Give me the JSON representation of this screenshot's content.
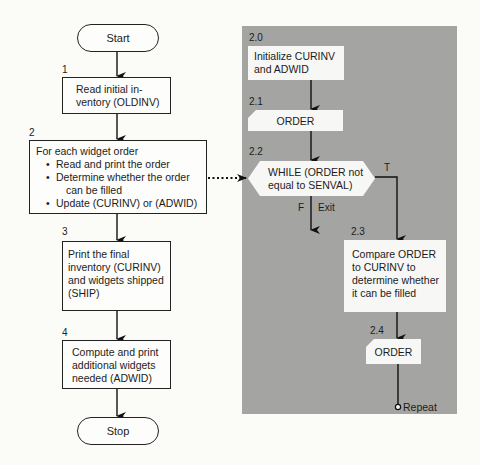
{
  "left_flow": {
    "start": {
      "label": "Start"
    },
    "step1": {
      "number": "1",
      "lines": [
        "Read initial in-",
        "ventory (OLDINV)"
      ]
    },
    "step2": {
      "number": "2",
      "heading": "For each widget order",
      "bullets": [
        "Read and print the order",
        "Determine whether the order",
        "Update (CURINV) or (ADWID)"
      ],
      "bullet2_continuation": "can be filled"
    },
    "step3": {
      "number": "3",
      "lines": [
        "Print the final",
        "inventory (CURINV)",
        "and widgets shipped",
        "(SHIP)"
      ]
    },
    "step4": {
      "number": "4",
      "lines": [
        "Compute and print",
        "additional widgets",
        "needed (ADWID)"
      ]
    },
    "stop": {
      "label": "Stop"
    }
  },
  "detail_panel": {
    "background_color": "#a4a4a2",
    "step2_0": {
      "number": "2.0",
      "lines": [
        "Initialize CURINV",
        "and ADWID"
      ]
    },
    "step2_1": {
      "number": "2.1",
      "label": "ORDER"
    },
    "step2_2": {
      "number": "2.2",
      "lines": [
        "WHILE (ORDER not",
        "equal to SENVAL)"
      ],
      "true_label": "T",
      "false_label": "F",
      "exit_label": "Exit"
    },
    "step2_3": {
      "number": "2.3",
      "lines": [
        "Compare ORDER",
        "to CURINV to",
        "determine whether",
        "it can be filled"
      ]
    },
    "step2_4": {
      "number": "2.4",
      "label": "ORDER"
    },
    "repeat_label": "Repeat"
  }
}
